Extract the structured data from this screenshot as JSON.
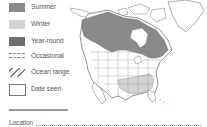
{
  "legend": {
    "items": [
      {
        "label": "Summer",
        "swatch": "#8a8a8a",
        "type": "fill"
      },
      {
        "label": "Winter",
        "swatch": "#d3d3d3",
        "type": "fill"
      },
      {
        "label": "Year-round",
        "swatch": "#6e6e6e",
        "type": "fill"
      },
      {
        "label": "Occasional",
        "swatch": "#888888",
        "type": "dashed"
      },
      {
        "label": "Ocean range",
        "swatch": "#777777",
        "type": "hatch"
      },
      {
        "label": "Date seen",
        "swatch": "#ffffff",
        "type": "box"
      }
    ]
  },
  "footer": {
    "location_label": "Location"
  },
  "map": {
    "region": "North America",
    "colors": {
      "summer": "#8a8a8a",
      "winter": "#d3d3d3",
      "land": "#ffffff",
      "border": "#666666"
    }
  }
}
